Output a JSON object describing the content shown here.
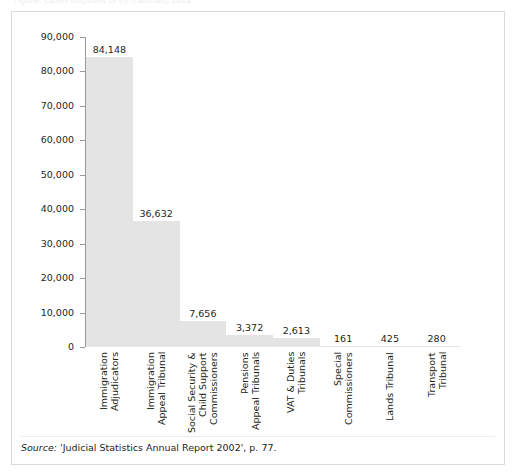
{
  "figure": {
    "clipped_caption": "Figure: Cases disposed of by tribunals, 2002",
    "source_label": "Source:",
    "source_text": " 'Judicial Statistics Annual Report 2002', p. 77."
  },
  "colors": {
    "bar_fill": "#e4e4e4",
    "axis": "#9a9a9a",
    "text": "#231f20",
    "box_border": "#d8dade"
  },
  "chart_data": {
    "type": "bar",
    "title": "",
    "xlabel": "",
    "ylabel": "",
    "ylim": [
      0,
      90000
    ],
    "ytick_labels": [
      "0",
      "10,000",
      "20,000",
      "30,000",
      "40,000",
      "50,000",
      "60,000",
      "70,000",
      "80,000",
      "90,000"
    ],
    "ytick_values": [
      0,
      10000,
      20000,
      30000,
      40000,
      50000,
      60000,
      70000,
      80000,
      90000
    ],
    "grid": false,
    "legend": "none",
    "categories": [
      "Immigration\nAdjudicators",
      "Immigration\nAppeal Tribunal",
      "Social Security &\nChild Support\nCommissioners",
      "Pensions\nAppeal Tribunals",
      "VAT & Duties\nTribunals",
      "Special\nCommissioners",
      "Lands Tribunal",
      "Transport\nTribunal"
    ],
    "category_lines": [
      [
        "Immigration",
        "Adjudicators"
      ],
      [
        "Immigration",
        "Appeal Tribunal"
      ],
      [
        "Social Security &",
        "Child Support",
        "Commissioners"
      ],
      [
        "Pensions",
        "Appeal Tribunals"
      ],
      [
        "VAT & Duties",
        "Tribunals"
      ],
      [
        "Special",
        "Commissioners"
      ],
      [
        "Lands Tribunal"
      ],
      [
        "Transport",
        "Tribunal"
      ]
    ],
    "values": [
      84148,
      36632,
      7656,
      3372,
      2613,
      161,
      425,
      280
    ],
    "value_labels": [
      "84,148",
      "36,632",
      "7,656",
      "3,372",
      "2,613",
      "161",
      "425",
      "280"
    ]
  }
}
